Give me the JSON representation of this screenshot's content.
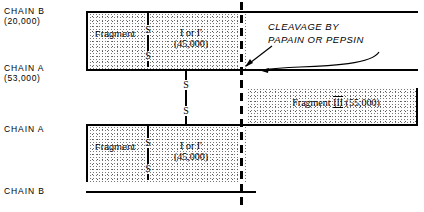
{
  "diagram": {
    "chain_labels": [
      {
        "id": "chain-b-top",
        "name": "CHAIN B",
        "mass": "(20,000)"
      },
      {
        "id": "chain-a-top",
        "name": "CHAIN A",
        "mass": "(53,000)"
      },
      {
        "id": "chain-a-bottom",
        "name": "CHAIN A",
        "mass": ""
      },
      {
        "id": "chain-b-bottom",
        "name": "CHAIN B",
        "mass": ""
      }
    ],
    "fragments": [
      {
        "id": "fragment-top-left",
        "label": "Fragment"
      },
      {
        "id": "fragment-bottom-left",
        "label": "Fragment"
      }
    ],
    "fragment_ids": [
      {
        "id": "fragment-i-top",
        "name": "I or I'",
        "mass": "(45,000)"
      },
      {
        "id": "fragment-i-bottom",
        "name": "I or I'",
        "mass": "(45,000)"
      }
    ],
    "fragment_three": {
      "label": "Fragment",
      "numeral": "III",
      "mass": "(55,000)"
    },
    "disulfide_bonds": [
      {
        "id": "ss-top",
        "top": "S",
        "bottom": "S"
      },
      {
        "id": "ss-middle",
        "top": "S",
        "bottom": "S"
      },
      {
        "id": "ss-bottom",
        "top": "S",
        "bottom": "S"
      }
    ],
    "annotation": {
      "line1": "CLEAVAGE BY",
      "line2": "PAPAIN OR PEPSIN"
    },
    "colors": {
      "ink": "#000000",
      "background": "#ffffff",
      "stipple": "#555555"
    }
  }
}
